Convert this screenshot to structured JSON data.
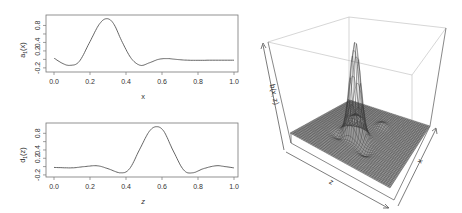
{
  "chart_data": [
    {
      "type": "line",
      "panel": "top-left",
      "title": "",
      "xlabel": "x",
      "ylabel": "a1(x)",
      "xlim": [
        0.0,
        1.0
      ],
      "ylim": [
        -0.25,
        1.0
      ],
      "x_ticks": [
        "0.0",
        "0.2",
        "0.4",
        "0.6",
        "0.8",
        "1.0"
      ],
      "y_ticks": [
        "-0.2",
        "0.2",
        "0.4",
        "0.8"
      ],
      "grid": false,
      "x": [
        0.0,
        0.05,
        0.09,
        0.14,
        0.2,
        0.25,
        0.29,
        0.33,
        0.38,
        0.43,
        0.48,
        0.53,
        0.58,
        0.63,
        0.68,
        0.75,
        0.85,
        1.0
      ],
      "values": [
        0.03,
        -0.1,
        -0.14,
        -0.05,
        0.42,
        0.82,
        0.96,
        0.85,
        0.4,
        0.02,
        -0.14,
        -0.08,
        0.0,
        0.02,
        0.0,
        -0.02,
        -0.02,
        -0.02
      ],
      "color": "#555555"
    },
    {
      "type": "line",
      "panel": "bottom-left",
      "title": "",
      "xlabel": "z",
      "ylabel": "d1(z)",
      "xlim": [
        0.0,
        1.0
      ],
      "ylim": [
        -0.25,
        1.0
      ],
      "x_ticks": [
        "0.0",
        "0.2",
        "0.4",
        "0.6",
        "0.8",
        "1.0"
      ],
      "y_ticks": [
        "-0.2",
        "0.2",
        "0.4",
        "0.8"
      ],
      "grid": false,
      "x": [
        0.0,
        0.1,
        0.17,
        0.24,
        0.3,
        0.37,
        0.42,
        0.48,
        0.53,
        0.57,
        0.61,
        0.66,
        0.72,
        0.77,
        0.83,
        0.9,
        0.95,
        1.0
      ],
      "values": [
        -0.02,
        -0.03,
        0.0,
        0.02,
        -0.05,
        -0.15,
        -0.05,
        0.45,
        0.85,
        0.96,
        0.85,
        0.4,
        -0.08,
        -0.15,
        -0.05,
        0.02,
        0.0,
        -0.03
      ],
      "color": "#555555"
    },
    {
      "type": "surface",
      "panel": "right",
      "title": "",
      "xlabel": "x",
      "ylabel": "z",
      "zlabel": "b(x, z)",
      "description": "3D wireframe perspective surface with a single tall central peak and small ripples on a flat base",
      "peak_location": {
        "x": 0.29,
        "z": 0.57
      },
      "peak_height": "max",
      "grid": false,
      "color": "#333333"
    }
  ],
  "labels": {
    "top_xlabel": "x",
    "top_ylabel_main": "a",
    "top_ylabel_sub": "1",
    "top_ylabel_arg": "(x)",
    "bottom_xlabel": "z",
    "bottom_ylabel_main": "d",
    "bottom_ylabel_sub": "1",
    "bottom_ylabel_arg": "(z)",
    "surface_zlabel": "b(x, z)",
    "surface_xlabel": "x",
    "surface_zaxis": "z",
    "xticks": [
      "0.0",
      "0.2",
      "0.4",
      "0.6",
      "0.8",
      "1.0"
    ],
    "yticks": [
      "-0.2",
      "0.2",
      "0.4",
      "0.8"
    ]
  }
}
